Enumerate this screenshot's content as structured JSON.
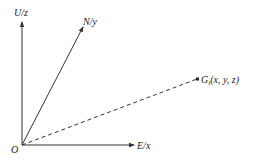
{
  "diagram": {
    "type": "coordinate-system",
    "colors": {
      "line": "#333333",
      "text": "#222222",
      "background": "#ffffff"
    },
    "origin": {
      "label": "O"
    },
    "axes": [
      {
        "id": "z",
        "label": "U/z"
      },
      {
        "id": "y",
        "label": "N/y"
      },
      {
        "id": "x",
        "label": "E/x"
      }
    ],
    "point": {
      "label_main": "G",
      "label_sub": "i",
      "label_coords": "(x, y, z)"
    }
  }
}
